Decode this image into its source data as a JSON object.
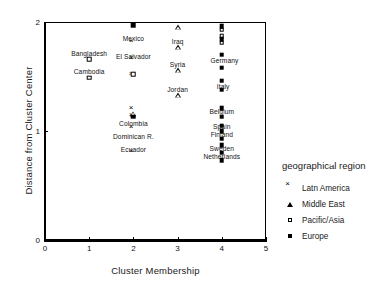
{
  "chart_data": {
    "type": "scatter",
    "title": "",
    "xlabel": "Cluster Membership",
    "ylabel": "Distance from Cluster Center",
    "xlim": [
      0,
      5
    ],
    "ylim": [
      0,
      2
    ],
    "xticks": [
      "0",
      "1",
      "2",
      "3",
      "4",
      "5"
    ],
    "yticks": [
      "0",
      "1",
      "2"
    ],
    "grid": false,
    "legend_position": "right",
    "legend_title": "geographical region",
    "series": [
      {
        "name": "Latn America",
        "marker": "cross",
        "points": [
          {
            "x": 2,
            "y": 1.79,
            "label": "Mexico"
          },
          {
            "x": 2,
            "y": 1.63,
            "label": "El Salvador"
          },
          {
            "x": 2,
            "y": 1.49,
            "label": ""
          },
          {
            "x": 2,
            "y": 1.11,
            "label": "Colombia"
          },
          {
            "x": 2,
            "y": 1.0,
            "label": "Dominican R."
          },
          {
            "x": 2,
            "y": 1.17,
            "label": ""
          },
          {
            "x": 2,
            "y": 0.78,
            "label": "Ecuador"
          }
        ]
      },
      {
        "name": "Middle East",
        "marker": "triangle",
        "points": [
          {
            "x": 3,
            "y": 1.95,
            "label": ""
          },
          {
            "x": 3,
            "y": 1.77,
            "label": "Iraq"
          },
          {
            "x": 3,
            "y": 1.56,
            "label": "Syria"
          },
          {
            "x": 3,
            "y": 1.33,
            "label": "Jordan"
          },
          {
            "x": 2,
            "y": 1.16,
            "label": ""
          }
        ]
      },
      {
        "name": "Pacific/Asia",
        "marker": "square-open",
        "points": [
          {
            "x": 1,
            "y": 1.66,
            "label": "Bangladesh"
          },
          {
            "x": 1,
            "y": 1.49,
            "label": "Cambodia"
          },
          {
            "x": 2,
            "y": 1.52,
            "label": ""
          },
          {
            "x": 4,
            "y": 1.93,
            "label": ""
          },
          {
            "x": 4,
            "y": 1.87,
            "label": ""
          },
          {
            "x": 4,
            "y": 1.81,
            "label": ""
          }
        ]
      },
      {
        "name": "Europe",
        "marker": "square-filled",
        "points": [
          {
            "x": 2,
            "y": 1.97,
            "label": ""
          },
          {
            "x": 2,
            "y": 1.13,
            "label": ""
          },
          {
            "x": 4,
            "y": 1.96,
            "label": ""
          },
          {
            "x": 4,
            "y": 1.84,
            "label": ""
          },
          {
            "x": 4,
            "y": 1.7,
            "label": "Germany"
          },
          {
            "x": 4,
            "y": 1.58,
            "label": ""
          },
          {
            "x": 4,
            "y": 1.46,
            "label": "Italy"
          },
          {
            "x": 4,
            "y": 1.38,
            "label": ""
          },
          {
            "x": 4,
            "y": 1.21,
            "label": "Belgium"
          },
          {
            "x": 4,
            "y": 1.13,
            "label": ""
          },
          {
            "x": 4,
            "y": 1.05,
            "label": "Spain"
          },
          {
            "x": 4,
            "y": 1.0,
            "label": "Finland"
          },
          {
            "x": 4,
            "y": 0.93,
            "label": ""
          },
          {
            "x": 4,
            "y": 0.87,
            "label": "Sweden"
          },
          {
            "x": 4,
            "y": 0.8,
            "label": "Netherlands"
          },
          {
            "x": 4,
            "y": 0.73,
            "label": ""
          }
        ]
      }
    ],
    "point_labels": [
      {
        "x": 2,
        "y": 1.84,
        "text": "Mexico"
      },
      {
        "x": 2,
        "y": 1.68,
        "text": "El Salvador"
      },
      {
        "x": 1,
        "y": 1.71,
        "text": "Bangladesh"
      },
      {
        "x": 1,
        "y": 1.54,
        "text": "Cambodia"
      },
      {
        "x": 3,
        "y": 1.82,
        "text": "Iraq"
      },
      {
        "x": 3,
        "y": 1.61,
        "text": "Syria"
      },
      {
        "x": 3,
        "y": 1.38,
        "text": "Jordan"
      },
      {
        "x": 2,
        "y": 1.06,
        "text": "Colombia"
      },
      {
        "x": 2,
        "y": 0.945,
        "text": "Dominican R."
      },
      {
        "x": 2,
        "y": 0.83,
        "text": "Ecuador"
      },
      {
        "x": 4.06,
        "y": 1.645,
        "text": "Germany"
      },
      {
        "x": 4.03,
        "y": 1.405,
        "text": "Italy"
      },
      {
        "x": 4.0,
        "y": 1.175,
        "text": "Belgium"
      },
      {
        "x": 4.0,
        "y": 1.035,
        "text": "Spain"
      },
      {
        "x": 4.0,
        "y": 0.965,
        "text": "Finland"
      },
      {
        "x": 4.0,
        "y": 0.835,
        "text": "Sweden"
      },
      {
        "x": 4.0,
        "y": 0.765,
        "text": "Netherlands"
      }
    ]
  },
  "legend": {
    "title": "geographical region",
    "items": [
      {
        "label": "Latn America",
        "marker": "cross",
        "icon": "cross-marker-icon"
      },
      {
        "label": "Middle East",
        "marker": "triangle",
        "icon": "triangle-marker-icon"
      },
      {
        "label": "Pacific/Asia",
        "marker": "square-open",
        "icon": "open-square-marker-icon"
      },
      {
        "label": "Europe",
        "marker": "square-filled",
        "icon": "filled-square-marker-icon"
      }
    ]
  }
}
